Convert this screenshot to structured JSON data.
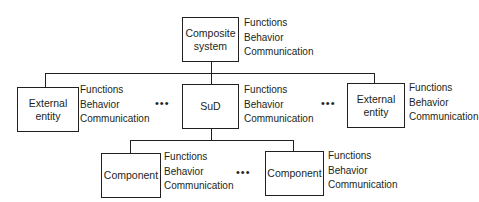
{
  "diagram": {
    "root": {
      "label": "Composite system",
      "label_lines": [
        "Composite",
        "system"
      ],
      "attributes": [
        "Functions",
        "Behavior",
        "Communication"
      ]
    },
    "level2": [
      {
        "label_lines": [
          "External",
          "entity"
        ],
        "attributes": [
          "Functions",
          "Behavior",
          "Communication"
        ]
      },
      {
        "label_lines": [
          "SuD"
        ],
        "attributes": [
          "Functions",
          "Behavior",
          "Communication"
        ]
      },
      {
        "label_lines": [
          "External",
          "entity"
        ],
        "attributes": [
          "Functions",
          "Behavior",
          "Communication"
        ]
      }
    ],
    "level3": [
      {
        "label_lines": [
          "Component"
        ],
        "attributes": [
          "Functions",
          "Behavior",
          "Communication"
        ]
      },
      {
        "label_lines": [
          "Component"
        ],
        "attributes": [
          "Functions",
          "Behavior",
          "Communication"
        ]
      }
    ],
    "ellipsis": "•••"
  }
}
